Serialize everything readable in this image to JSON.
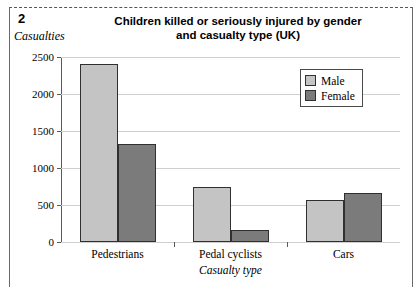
{
  "figure": {
    "number": "2",
    "y_axis_title": "Casualties",
    "x_axis_title": "Casualty type",
    "title": "Children killed or seriously injured by gender and casualty type (UK)",
    "title_line1": "Children killed or seriously injured by gender",
    "title_line2": "and casualty type (UK)"
  },
  "legend": {
    "items": [
      {
        "label": "Male",
        "color": "#c4c4c4",
        "swatch": "male"
      },
      {
        "label": "Female",
        "color": "#7b7b7b",
        "swatch": "female"
      }
    ]
  },
  "axis": {
    "y_ticks": [
      "2500",
      "2000",
      "1500",
      "1000",
      "500",
      "0"
    ],
    "x_ticks": [
      "Pedestrians",
      "Pedal cyclists",
      "Cars"
    ]
  },
  "chart_data": {
    "type": "bar",
    "title": "Children killed or seriously injured by gender and casualty type (UK)",
    "xlabel": "Casualty type",
    "ylabel": "Casualties",
    "categories": [
      "Pedestrians",
      "Pedal cyclists",
      "Cars"
    ],
    "series": [
      {
        "name": "Male",
        "color": "#c4c4c4",
        "values": [
          2400,
          750,
          570
        ]
      },
      {
        "name": "Female",
        "color": "#7b7b7b",
        "values": [
          1330,
          165,
          665
        ]
      }
    ],
    "ylim": [
      0,
      2500
    ],
    "ytick_step": 500,
    "grid": true,
    "legend_position": "top-right"
  }
}
